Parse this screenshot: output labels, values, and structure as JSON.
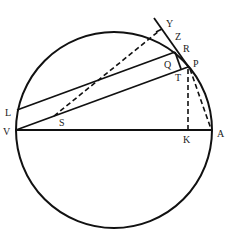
{
  "diagram": {
    "type": "geometry",
    "stroke_color": "#111111",
    "background": "#ffffff",
    "circle": {
      "cx": 114,
      "cy": 130,
      "r": 98
    },
    "labels": {
      "Y": "Y",
      "Z": "Z",
      "R": "R",
      "P": "P",
      "Q": "Q",
      "T": "T",
      "L": "L",
      "V": "V",
      "S": "S",
      "K": "K",
      "A": "A"
    },
    "points": {
      "V": [
        16,
        130
      ],
      "A": [
        212,
        130
      ],
      "K": [
        188,
        130
      ],
      "L": [
        17,
        110
      ],
      "R": [
        175,
        52
      ],
      "P": [
        188,
        67
      ],
      "T": [
        181,
        69
      ],
      "Y": [
        162,
        29
      ],
      "S": [
        54,
        116
      ]
    },
    "segments": [
      {
        "name": "diameter-VA",
        "from": "V",
        "to": "A",
        "style": "solid"
      },
      {
        "name": "chord-VP",
        "from": "V",
        "to": "P",
        "style": "solid"
      },
      {
        "name": "chord-LR",
        "from": "L",
        "to": "R",
        "style": "solid"
      },
      {
        "name": "tangent-line",
        "from": [
          154,
          18
        ],
        "to": [
          190,
          69
        ],
        "style": "solid"
      },
      {
        "name": "segment-RT",
        "from": "R",
        "to": "T",
        "style": "solid"
      },
      {
        "name": "dashed-SY",
        "from": "S",
        "to": "Y",
        "style": "dashed"
      },
      {
        "name": "dashed-PK",
        "from": "P",
        "to": "K",
        "style": "dashed"
      },
      {
        "name": "dashed-PA",
        "from": "P",
        "to": "A",
        "style": "dashed"
      }
    ]
  }
}
